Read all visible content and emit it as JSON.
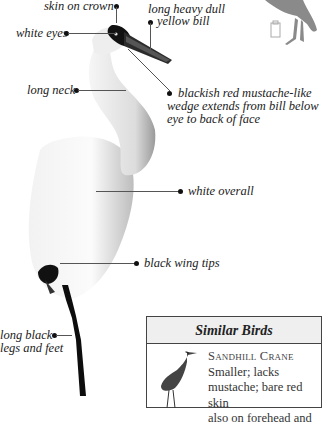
{
  "annotations": {
    "skin_on_crown": "skin on crown",
    "bill_line1": "long heavy dull",
    "bill_line2": "yellow bill",
    "white_eyes": "white eyes",
    "long_neck": "long neck",
    "mustache_line1": "blackish red mustache-like",
    "mustache_line2": "wedge extends from bill below",
    "mustache_line3": "eye to back of face",
    "white_overall": "white overall",
    "black_wing_tips": "black wing tips",
    "legs_line1": "long black",
    "legs_line2": "legs and feet"
  },
  "similar_birds": {
    "title": "Similar Birds",
    "items": [
      {
        "name": "Sandhill Crane",
        "desc_line1": "Smaller; lacks",
        "desc_line2": "mustache; bare red skin",
        "desc_line3": "also on forehead and"
      }
    ]
  },
  "colors": {
    "silhouette": "#8a8a8a",
    "box_border": "#444444",
    "box_header_bg": "#efefef"
  }
}
